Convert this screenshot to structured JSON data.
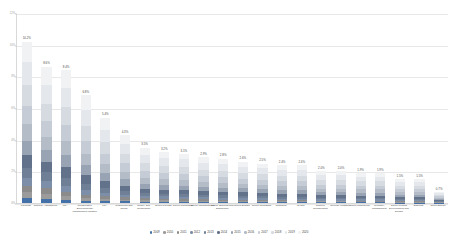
{
  "chart_data": {
    "type": "bar",
    "subtype": "stacked-column",
    "title": "",
    "xlabel": "",
    "ylabel": "",
    "ylim": [
      0,
      12
    ],
    "grid": true,
    "legend_position": "bottom",
    "ytick_labels": [
      "0%",
      "2%",
      "4%",
      "6%",
      "8%",
      "10%",
      "12%"
    ],
    "ytick_values": [
      0,
      2,
      4,
      6,
      8,
      10,
      12
    ],
    "categories": [
      "Forecast",
      "Supplier Assessment",
      "LCA",
      "Collaborative Environmental Management Initiative",
      "KPI",
      "Resources and Reuse",
      "Supply and Certification",
      "Green Process",
      "Green Purchasing",
      "Green Manufacturing",
      "Green Shipping and Distribution",
      "Green Design",
      "Green Packaging",
      "Research",
      "GHRM",
      "Supplier Collaboration",
      "Reverse Logistics",
      "Green Warehouse",
      "Inventory Management",
      "Green Product Development and Design",
      "Disposal",
      "Green Energy"
    ],
    "totals": [
      10.2,
      8.6,
      8.4,
      6.8,
      5.4,
      4.3,
      3.5,
      3.2,
      3.1,
      2.9,
      2.8,
      2.6,
      2.5,
      2.4,
      2.4,
      2.0,
      2.0,
      1.9,
      1.9,
      1.5,
      1.5,
      0.7
    ],
    "value_labels": [
      "10.2%",
      "8.6%",
      "8.4%",
      "6.8%",
      "5.4%",
      "4.3%",
      "3.5%",
      "3.2%",
      "3.1%",
      "2.9%",
      "2.8%",
      "2.6%",
      "2.5%",
      "2.4%",
      "2.4%",
      "2.0%",
      "2.0%",
      "1.9%",
      "1.9%",
      "1.5%",
      "1.5%",
      "0.7%"
    ],
    "series": [
      {
        "name": "2009",
        "color": "#4472a8",
        "values": [
          0.35,
          0.3,
          0.2,
          0.15,
          0.12,
          0.1,
          0.08,
          0.08,
          0.07,
          0.07,
          0.06,
          0.06,
          0.06,
          0.05,
          0.05,
          0.05,
          0.05,
          0.04,
          0.04,
          0.03,
          0.03,
          0.02
        ]
      },
      {
        "name": "2010",
        "color": "#9b9b9b",
        "values": [
          0.4,
          0.35,
          0.25,
          0.18,
          0.14,
          0.12,
          0.1,
          0.09,
          0.08,
          0.08,
          0.07,
          0.07,
          0.07,
          0.06,
          0.06,
          0.05,
          0.05,
          0.05,
          0.05,
          0.04,
          0.04,
          0.02
        ]
      },
      {
        "name": "2011",
        "color": "#8b8b8b",
        "values": [
          0.45,
          0.4,
          0.3,
          0.22,
          0.18,
          0.14,
          0.12,
          0.11,
          0.1,
          0.09,
          0.09,
          0.08,
          0.08,
          0.07,
          0.07,
          0.06,
          0.06,
          0.06,
          0.06,
          0.05,
          0.05,
          0.02
        ]
      },
      {
        "name": "2012",
        "color": "#7d8fa8",
        "values": [
          0.55,
          0.5,
          0.4,
          0.3,
          0.24,
          0.18,
          0.15,
          0.14,
          0.13,
          0.12,
          0.12,
          0.11,
          0.1,
          0.1,
          0.1,
          0.08,
          0.08,
          0.08,
          0.08,
          0.06,
          0.06,
          0.03
        ]
      },
      {
        "name": "2013",
        "color": "#6e7f96",
        "values": [
          0.7,
          0.62,
          0.55,
          0.42,
          0.32,
          0.25,
          0.2,
          0.18,
          0.18,
          0.16,
          0.16,
          0.15,
          0.14,
          0.13,
          0.13,
          0.11,
          0.11,
          0.1,
          0.1,
          0.08,
          0.08,
          0.04
        ]
      },
      {
        "name": "2014",
        "color": "#61728a",
        "values": [
          0.85,
          0.72,
          0.7,
          0.55,
          0.42,
          0.33,
          0.27,
          0.24,
          0.24,
          0.22,
          0.21,
          0.2,
          0.19,
          0.18,
          0.18,
          0.15,
          0.15,
          0.14,
          0.14,
          0.11,
          0.11,
          0.05
        ]
      },
      {
        "name": "2015",
        "color": "#98a3b3",
        "values": [
          1.0,
          0.84,
          0.82,
          0.66,
          0.52,
          0.41,
          0.34,
          0.31,
          0.3,
          0.28,
          0.27,
          0.25,
          0.24,
          0.23,
          0.23,
          0.19,
          0.19,
          0.18,
          0.18,
          0.14,
          0.14,
          0.06
        ]
      },
      {
        "name": "2016",
        "color": "#b4bcc8",
        "values": [
          1.15,
          0.96,
          0.94,
          0.76,
          0.6,
          0.48,
          0.39,
          0.36,
          0.35,
          0.32,
          0.31,
          0.29,
          0.28,
          0.27,
          0.27,
          0.22,
          0.22,
          0.21,
          0.21,
          0.17,
          0.17,
          0.08
        ]
      },
      {
        "name": "2017",
        "color": "#c6ccd5",
        "values": [
          1.3,
          1.1,
          1.07,
          0.87,
          0.69,
          0.55,
          0.45,
          0.41,
          0.4,
          0.37,
          0.36,
          0.33,
          0.32,
          0.31,
          0.31,
          0.26,
          0.26,
          0.24,
          0.24,
          0.19,
          0.19,
          0.09
        ]
      },
      {
        "name": "2018",
        "color": "#d6dbe1",
        "values": [
          1.45,
          1.22,
          1.19,
          0.96,
          0.76,
          0.61,
          0.5,
          0.45,
          0.44,
          0.41,
          0.4,
          0.37,
          0.35,
          0.34,
          0.34,
          0.28,
          0.28,
          0.27,
          0.27,
          0.21,
          0.21,
          0.1
        ]
      },
      {
        "name": "2019",
        "color": "#e4e8ec",
        "values": [
          1.55,
          1.31,
          1.28,
          1.04,
          0.82,
          0.66,
          0.53,
          0.49,
          0.47,
          0.44,
          0.43,
          0.4,
          0.38,
          0.37,
          0.37,
          0.31,
          0.31,
          0.29,
          0.29,
          0.23,
          0.23,
          0.11
        ]
      },
      {
        "name": "2020",
        "color": "#f0f2f4",
        "values": [
          1.45,
          1.28,
          1.2,
          0.99,
          0.79,
          0.57,
          0.47,
          0.34,
          0.34,
          0.34,
          0.32,
          0.29,
          0.29,
          0.29,
          0.29,
          0.24,
          0.24,
          0.23,
          0.23,
          0.19,
          0.19,
          0.07
        ]
      }
    ]
  },
  "axis": {
    "y_title": "",
    "x_title": ""
  }
}
